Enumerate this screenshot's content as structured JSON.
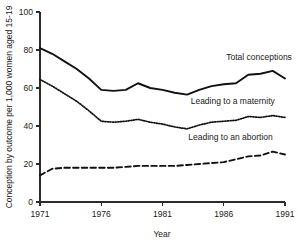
{
  "chart_data": {
    "type": "line",
    "title": "",
    "xlabel": "Year",
    "ylabel": "Conception by outcome per 1,000 women aged 15-19",
    "xlim": [
      1971,
      1991
    ],
    "ylim": [
      0,
      100
    ],
    "xticks": [
      "1971",
      "1976",
      "1981",
      "1986",
      "1991"
    ],
    "yticks": [
      "0",
      "20",
      "40",
      "60",
      "80",
      "100"
    ],
    "grid": false,
    "legend_position": "inline-annotations",
    "x": [
      1971,
      1972,
      1973,
      1974,
      1975,
      1976,
      1977,
      1978,
      1979,
      1980,
      1981,
      1982,
      1983,
      1984,
      1985,
      1986,
      1987,
      1988,
      1989,
      1990,
      1991
    ],
    "series": [
      {
        "name": "Total conceptions",
        "style": "solid",
        "values": [
          81,
          78,
          74,
          70,
          65,
          59,
          58.5,
          59,
          62.5,
          60,
          59,
          57.5,
          56.5,
          59,
          61,
          62,
          62.5,
          67,
          67.5,
          69,
          65
        ]
      },
      {
        "name": "Leading to a maternity",
        "style": "dotted",
        "values": [
          64.5,
          61,
          57,
          53,
          48,
          42.5,
          42,
          42.5,
          43.5,
          42,
          41,
          39.5,
          38.5,
          40.5,
          42,
          42.5,
          43,
          45,
          44.5,
          45.5,
          44.5
        ]
      },
      {
        "name": "Leading to an abortion",
        "style": "dashed",
        "values": [
          14,
          17.5,
          18,
          18,
          18,
          18,
          18,
          18.5,
          19,
          19,
          19,
          19,
          19.5,
          20,
          20.5,
          21,
          22.5,
          24,
          24.5,
          26.5,
          25
        ]
      }
    ],
    "annotations": [
      {
        "text": "Total conceptions",
        "x": 1986.2,
        "y": 74.5
      },
      {
        "text": "Leading to a maternity",
        "x": 1983.3,
        "y": 51.5
      },
      {
        "text": "Leading to an abortion",
        "x": 1983.1,
        "y": 32.5
      }
    ]
  }
}
